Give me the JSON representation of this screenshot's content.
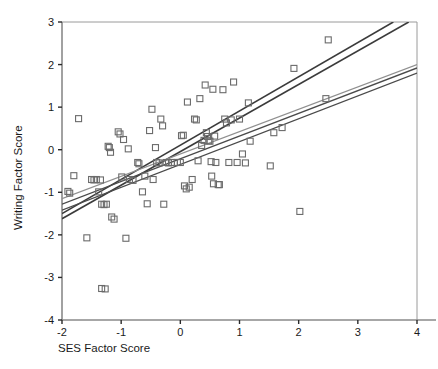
{
  "chart_data": {
    "type": "scatter",
    "title": "",
    "xlabel": "SES Factor Score",
    "ylabel": "Writing Factor Score",
    "xlim": [
      -2,
      4
    ],
    "ylim": [
      -4,
      3
    ],
    "xticks": [
      -2,
      -1,
      0,
      1,
      2,
      3,
      4
    ],
    "yticks": [
      -4,
      -3,
      -2,
      -1,
      0,
      1,
      2,
      3
    ],
    "xticklabels": [
      "-2",
      "-1",
      "0",
      "1",
      "2",
      "3",
      "4"
    ],
    "yticklabels": [
      "-4",
      "-3",
      "-2",
      "-1",
      "0",
      "1",
      "2",
      "3"
    ],
    "grid": false,
    "legend": "none",
    "marker": "open-square",
    "marker_size_px": 6,
    "marker_color": "#6b6b6b",
    "points": [
      [
        -1.9,
        -0.98
      ],
      [
        -1.87,
        -1.02
      ],
      [
        -1.8,
        -0.61
      ],
      [
        -1.72,
        0.73
      ],
      [
        -1.58,
        -2.07
      ],
      [
        -1.5,
        -0.7
      ],
      [
        -1.46,
        -0.71
      ],
      [
        -1.42,
        -0.7
      ],
      [
        -1.38,
        -0.99
      ],
      [
        -1.35,
        -0.71
      ],
      [
        -1.33,
        -3.26
      ],
      [
        -1.27,
        -3.27
      ],
      [
        -1.33,
        -1.28
      ],
      [
        -1.29,
        -1.29
      ],
      [
        -1.25,
        -1.28
      ],
      [
        -1.22,
        0.08
      ],
      [
        -1.2,
        0.05
      ],
      [
        -1.18,
        -0.06
      ],
      [
        -1.16,
        -1.58
      ],
      [
        -1.12,
        -1.63
      ],
      [
        -1.05,
        0.42
      ],
      [
        -1.02,
        0.37
      ],
      [
        -0.99,
        -0.64
      ],
      [
        -0.96,
        0.24
      ],
      [
        -0.92,
        -2.08
      ],
      [
        -0.88,
        0.02
      ],
      [
        -0.86,
        -0.7
      ],
      [
        -0.8,
        -0.72
      ],
      [
        -0.72,
        -0.3
      ],
      [
        -0.7,
        -0.33
      ],
      [
        -0.64,
        -0.99
      ],
      [
        -0.6,
        -0.62
      ],
      [
        -0.56,
        -1.27
      ],
      [
        -0.52,
        0.45
      ],
      [
        -0.48,
        0.95
      ],
      [
        -0.46,
        -0.7
      ],
      [
        -0.42,
        0.05
      ],
      [
        -0.4,
        -0.3
      ],
      [
        -0.36,
        -0.31
      ],
      [
        -0.33,
        0.72
      ],
      [
        -0.3,
        0.56
      ],
      [
        -0.28,
        -1.28
      ],
      [
        -0.24,
        -0.3
      ],
      [
        -0.2,
        -0.31
      ],
      [
        -0.15,
        -0.3
      ],
      [
        -0.1,
        -0.3
      ],
      [
        -0.05,
        -0.3
      ],
      [
        0.0,
        -0.3
      ],
      [
        0.02,
        0.33
      ],
      [
        0.05,
        0.34
      ],
      [
        0.07,
        -0.85
      ],
      [
        0.1,
        -0.92
      ],
      [
        0.12,
        1.12
      ],
      [
        0.15,
        -0.88
      ],
      [
        0.2,
        -0.7
      ],
      [
        0.24,
        0.72
      ],
      [
        0.27,
        0.7
      ],
      [
        0.3,
        -0.26
      ],
      [
        0.33,
        1.2
      ],
      [
        0.36,
        0.1
      ],
      [
        0.4,
        0.22
      ],
      [
        0.42,
        1.52
      ],
      [
        0.44,
        0.4
      ],
      [
        0.46,
        0.31
      ],
      [
        0.48,
        0.21
      ],
      [
        0.5,
        0.2
      ],
      [
        0.52,
        -0.28
      ],
      [
        0.53,
        -0.62
      ],
      [
        0.55,
        1.42
      ],
      [
        0.56,
        -0.8
      ],
      [
        0.58,
        0.32
      ],
      [
        0.6,
        -0.3
      ],
      [
        0.64,
        -0.82
      ],
      [
        0.66,
        -0.82
      ],
      [
        0.72,
        1.41
      ],
      [
        0.75,
        0.72
      ],
      [
        0.78,
        0.63
      ],
      [
        0.82,
        -0.3
      ],
      [
        0.86,
        0.7
      ],
      [
        0.9,
        1.59
      ],
      [
        0.96,
        -0.3
      ],
      [
        1.0,
        0.72
      ],
      [
        1.05,
        -0.1
      ],
      [
        1.1,
        -0.31
      ],
      [
        1.15,
        1.1
      ],
      [
        1.18,
        0.2
      ],
      [
        1.52,
        -0.38
      ],
      [
        1.58,
        0.4
      ],
      [
        1.72,
        0.52
      ],
      [
        1.92,
        1.91
      ],
      [
        2.02,
        -1.45
      ],
      [
        2.46,
        1.2
      ],
      [
        2.5,
        2.58
      ]
    ],
    "fit_lines": [
      {
        "name": "steep-dark-upper",
        "color": "#3b3b3b",
        "width": 1.6,
        "x0": -2.0,
        "y0": -1.5,
        "x1": 3.6,
        "y1": 3.0
      },
      {
        "name": "steep-dark-lower",
        "color": "#3b3b3b",
        "width": 1.6,
        "x0": -2.0,
        "y0": -1.62,
        "x1": 3.86,
        "y1": 3.0
      },
      {
        "name": "shallow-gray-upper",
        "color": "#909090",
        "width": 1.2,
        "x0": -2.0,
        "y0": -1.15,
        "x1": 4.0,
        "y1": 2.0
      },
      {
        "name": "shallow-dark-middle",
        "color": "#4a4a4a",
        "width": 1.3,
        "x0": -2.0,
        "y0": -1.28,
        "x1": 4.0,
        "y1": 1.92
      },
      {
        "name": "shallow-dark-lower",
        "color": "#4a4a4a",
        "width": 1.3,
        "x0": -2.0,
        "y0": -1.42,
        "x1": 4.0,
        "y1": 1.8
      }
    ]
  },
  "axes": {
    "x_title": "SES Factor Score",
    "y_title": "Writing Factor Score"
  }
}
